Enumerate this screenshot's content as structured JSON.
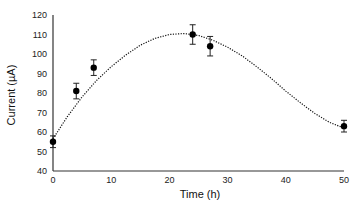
{
  "chart_data": {
    "type": "scatter",
    "title": "",
    "xlabel": "Time (h)",
    "ylabel": "Current (µA)",
    "xlim": [
      0,
      50
    ],
    "ylim": [
      40,
      120
    ],
    "xticks": [
      0,
      10,
      20,
      30,
      40,
      50
    ],
    "yticks": [
      40,
      50,
      60,
      70,
      80,
      90,
      100,
      110,
      120
    ],
    "grid": false,
    "legend": null,
    "series": [
      {
        "name": "Measured current",
        "style": "marker",
        "color": "#000000",
        "x": [
          0,
          4,
          7,
          24,
          27,
          50
        ],
        "y": [
          55,
          81,
          93,
          110,
          104,
          63
        ],
        "error": [
          3,
          4,
          4,
          5,
          5,
          3
        ]
      },
      {
        "name": "Trendline",
        "style": "dotted-line",
        "color": "#000000",
        "x": [
          0,
          2.5,
          5,
          7.5,
          10,
          12.5,
          15,
          17.5,
          20,
          22.5,
          25,
          27.5,
          30,
          32.5,
          35,
          37.5,
          40,
          42.5,
          45,
          47.5,
          50
        ],
        "y": [
          56.5,
          68,
          78,
          86.5,
          93.5,
          99.5,
          104.5,
          108,
          110,
          110.5,
          109.5,
          107,
          103.5,
          99,
          93.5,
          87.5,
          81,
          75,
          69.5,
          65,
          62
        ]
      }
    ]
  }
}
